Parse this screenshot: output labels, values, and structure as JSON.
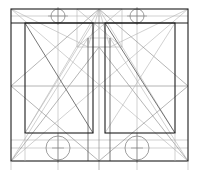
{
  "figure": {
    "title": "",
    "type": "geometric-line-construction-drawing",
    "canvas": {
      "width": 199,
      "height": 174,
      "background": "#ffffff"
    },
    "palette": {
      "heavy_line": "#1d1d1d",
      "medium_line": "#555555",
      "light_line": "#8d8d8d",
      "faint_line": "#b2b2b2",
      "circle_line": "#7d7d7d"
    }
  },
  "geometry": {
    "outer_frame": {
      "x1": 11,
      "y1": 9,
      "x2": 188,
      "y2": 161
    },
    "center_axis_x": 99,
    "mid_horizontal_y": 86,
    "top_band_y": 23,
    "inner_panels": [
      {
        "name": "left-panel",
        "x1": 25,
        "y1": 23,
        "x2": 93,
        "y2": 133
      },
      {
        "name": "right-panel",
        "x1": 105,
        "y1": 23,
        "x2": 175,
        "y2": 133
      }
    ],
    "center_box": {
      "x1": 77,
      "y1": 9,
      "x2": 122,
      "y2": 47
    },
    "center_inner_box": {
      "x1": 88,
      "y1": 38,
      "x2": 110,
      "y2": 47
    },
    "circles": [
      {
        "name": "top-left-circle",
        "cx": 58,
        "cy": 16,
        "r": 7
      },
      {
        "name": "top-right-circle",
        "cx": 137,
        "cy": 16,
        "r": 7
      },
      {
        "name": "bottom-left-circle",
        "cx": 58,
        "cy": 148,
        "r": 12
      },
      {
        "name": "bottom-right-circle",
        "cx": 137,
        "cy": 148,
        "r": 12
      }
    ],
    "horizontal_guides_y": [
      16,
      23,
      47,
      86,
      133,
      140,
      148,
      161
    ],
    "vertical_guides_x": [
      11,
      25,
      58,
      77,
      88,
      99,
      110,
      122,
      137,
      175,
      188
    ],
    "diagonals": [
      {
        "name": "outer-diag-tl-br",
        "x1": 11,
        "y1": 9,
        "x2": 188,
        "y2": 161
      },
      {
        "name": "outer-diag-tr-bl",
        "x1": 188,
        "y1": 9,
        "x2": 11,
        "y2": 161
      },
      {
        "name": "panel-diag-left-down",
        "x1": 25,
        "y1": 23,
        "x2": 93,
        "y2": 133
      },
      {
        "name": "panel-diag-left-up",
        "x1": 25,
        "y1": 133,
        "x2": 93,
        "y2": 23
      },
      {
        "name": "panel-diag-right-down",
        "x1": 105,
        "y1": 23,
        "x2": 175,
        "y2": 133
      },
      {
        "name": "panel-diag-right-up",
        "x1": 105,
        "y1": 133,
        "x2": 175,
        "y2": 23
      },
      {
        "name": "apex-fan-left",
        "x1": 99,
        "y1": 9,
        "x2": 11,
        "y2": 86
      },
      {
        "name": "apex-fan-right",
        "x1": 99,
        "y1": 9,
        "x2": 188,
        "y2": 86
      },
      {
        "name": "apex-fan-left-low",
        "x1": 99,
        "y1": 9,
        "x2": 25,
        "y2": 133
      },
      {
        "name": "apex-fan-right-low",
        "x1": 99,
        "y1": 9,
        "x2": 175,
        "y2": 133
      },
      {
        "name": "base-fan-left",
        "x1": 11,
        "y1": 161,
        "x2": 99,
        "y2": 47
      },
      {
        "name": "base-fan-right",
        "x1": 188,
        "y1": 161,
        "x2": 99,
        "y2": 47
      },
      {
        "name": "base-fan-left-2",
        "x1": 11,
        "y1": 161,
        "x2": 88,
        "y2": 38
      },
      {
        "name": "base-fan-right-2",
        "x1": 188,
        "y1": 161,
        "x2": 110,
        "y2": 38
      },
      {
        "name": "cross-left-long",
        "x1": 11,
        "y1": 86,
        "x2": 99,
        "y2": 161
      },
      {
        "name": "cross-right-long",
        "x1": 188,
        "y1": 86,
        "x2": 99,
        "y2": 161
      },
      {
        "name": "center-v-left",
        "x1": 88,
        "y1": 38,
        "x2": 88,
        "y2": 161
      },
      {
        "name": "center-v-right",
        "x1": 110,
        "y1": 38,
        "x2": 110,
        "y2": 161
      }
    ]
  },
  "labels": {
    "visible_text": []
  }
}
